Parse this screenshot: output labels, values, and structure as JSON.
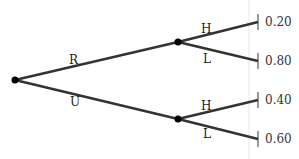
{
  "tree": {
    "root_branches": [
      {
        "label": "R"
      },
      {
        "label": "U"
      }
    ],
    "sub_branches": [
      {
        "parent": "R",
        "label": "H",
        "probability": "0.20"
      },
      {
        "parent": "R",
        "label": "L",
        "probability": "0.80"
      },
      {
        "parent": "U",
        "label": "H",
        "probability": "0.40"
      },
      {
        "parent": "U",
        "label": "L",
        "probability": "0.60"
      }
    ]
  },
  "colors": {
    "line": "#333333",
    "node": "#000000",
    "divider": "#e6e6e6"
  }
}
